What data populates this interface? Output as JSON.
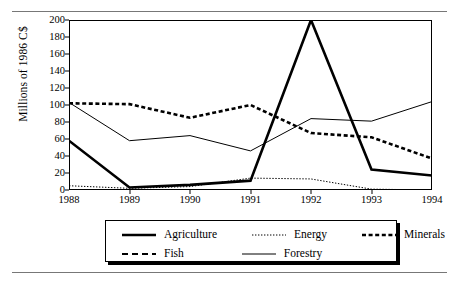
{
  "chart_data": {
    "type": "line",
    "title": "",
    "xlabel": "",
    "ylabel": "Millions of 1986 C$",
    "categories": [
      "1988",
      "1989",
      "1990",
      "1991",
      "1992",
      "1993",
      "1994"
    ],
    "x": [
      1988,
      1989,
      1990,
      1991,
      1992,
      1993,
      1994
    ],
    "ylim": [
      0,
      200
    ],
    "yticks": [
      0,
      20,
      40,
      60,
      80,
      100,
      120,
      140,
      160,
      180,
      200
    ],
    "grid": false,
    "legend_position": "bottom",
    "series": [
      {
        "name": "Agriculture",
        "style": "solid-thick",
        "color": "#000000",
        "values": [
          58,
          3,
          6,
          11,
          200,
          24,
          17
        ]
      },
      {
        "name": "Energy",
        "style": "dotted-fine",
        "color": "#000000",
        "values": [
          5,
          2,
          4,
          14,
          13,
          1,
          0
        ]
      },
      {
        "name": "Minerals",
        "style": "dashed-thick",
        "color": "#000000",
        "values": [
          102,
          101,
          85,
          100,
          67,
          62,
          37
        ]
      },
      {
        "name": "Fish",
        "style": "dashed-medium",
        "color": "#000000",
        "values": [
          0,
          0,
          0,
          0,
          0,
          0,
          0
        ]
      },
      {
        "name": "Forestry",
        "style": "solid-thin",
        "color": "#000000",
        "values": [
          103,
          58,
          64,
          46,
          84,
          81,
          104
        ]
      }
    ]
  },
  "axis": {
    "y_title": "Millions of 1986 C$",
    "y_tick_labels": [
      "0",
      "20",
      "40",
      "60",
      "80",
      "100",
      "120",
      "140",
      "160",
      "180",
      "200"
    ],
    "x_tick_labels": [
      "1988",
      "1989",
      "1990",
      "1991",
      "1992",
      "1993",
      "1994"
    ]
  },
  "legend": {
    "items": [
      {
        "label": "Agriculture",
        "style": "solid-thick"
      },
      {
        "label": "Energy",
        "style": "dotted-fine"
      },
      {
        "label": "Minerals",
        "style": "dashed-thick"
      },
      {
        "label": "Fish",
        "style": "dashed-medium"
      },
      {
        "label": "Forestry",
        "style": "solid-thin"
      }
    ]
  }
}
